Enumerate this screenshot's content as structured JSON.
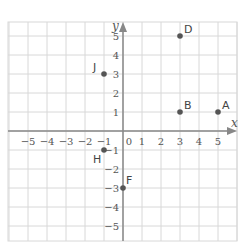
{
  "chart_data": {
    "type": "scatter",
    "title": "",
    "xlabel": "x",
    "ylabel": "y",
    "xlim": [
      -6,
      6
    ],
    "ylim": [
      -6,
      6
    ],
    "grid": true,
    "x_ticks": [
      -5,
      -4,
      -3,
      -2,
      -1,
      0,
      1,
      2,
      3,
      4,
      5
    ],
    "y_ticks": [
      -5,
      -4,
      -3,
      -2,
      -1,
      1,
      2,
      3,
      4,
      5
    ],
    "points": [
      {
        "label": "A",
        "x": 5,
        "y": 1
      },
      {
        "label": "B",
        "x": 3,
        "y": 1
      },
      {
        "label": "D",
        "x": 3,
        "y": 5
      },
      {
        "label": "J",
        "x": -1,
        "y": 3
      },
      {
        "label": "H",
        "x": -1,
        "y": -1
      },
      {
        "label": "F",
        "x": 0,
        "y": -3
      }
    ]
  },
  "colors": {
    "grid": "#d8d8d8",
    "axis": "#888888",
    "point": "#555555",
    "text": "#555555"
  }
}
